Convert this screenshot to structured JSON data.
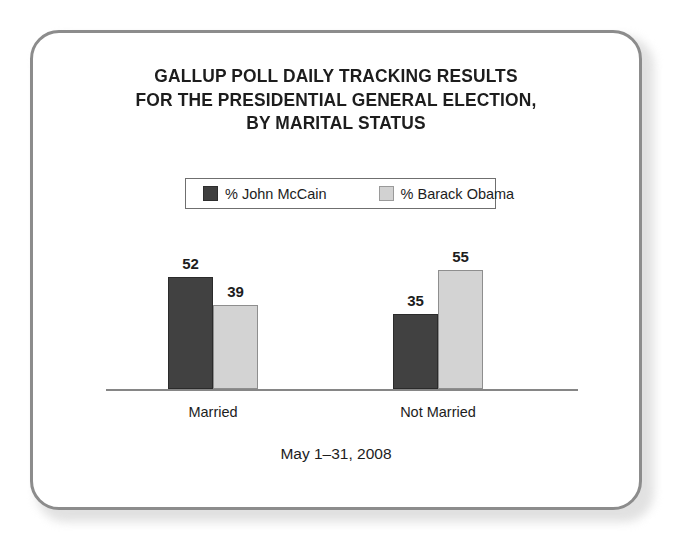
{
  "frame": {
    "border_color": "#8c8c8c",
    "background": "#ffffff"
  },
  "chart_data": {
    "type": "bar",
    "title": "GALLUP POLL DAILY TRACKING RESULTS FOR THE PRESIDENTIAL GENERAL ELECTION, BY MARITAL STATUS",
    "title_lines": [
      "GALLUP POLL DAILY TRACKING RESULTS",
      "FOR THE PRESIDENTIAL GENERAL ELECTION,",
      "BY MARITAL STATUS"
    ],
    "subtitle": "May 1–31, 2008",
    "categories": [
      "Married",
      "Not Married"
    ],
    "series": [
      {
        "name": "% John McCain",
        "color": "#414141",
        "values": [
          52,
          35
        ]
      },
      {
        "name": "% Barack Obama",
        "color": "#d3d3d3",
        "values": [
          39,
          55
        ]
      }
    ],
    "xlabel": "",
    "ylabel": "",
    "ylim": [
      0,
      77
    ],
    "grid": false,
    "axis_visible": "x-baseline-only",
    "legend_position": "top-center",
    "data_labels": true
  },
  "legend": {
    "entries": [
      {
        "label": "% John McCain",
        "swatch": "dark"
      },
      {
        "label": "% Barack Obama",
        "swatch": "light"
      }
    ]
  },
  "bars": {
    "married": {
      "category": "Married",
      "mccain": {
        "value": 52,
        "label": "52"
      },
      "obama": {
        "value": 39,
        "label": "39"
      }
    },
    "not_married": {
      "category": "Not Married",
      "mccain": {
        "value": 35,
        "label": "35"
      },
      "obama": {
        "value": 55,
        "label": "55"
      }
    }
  },
  "footer": {
    "date_range": "May 1–31, 2008"
  }
}
